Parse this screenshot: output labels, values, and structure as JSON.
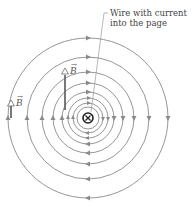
{
  "diagram": {
    "annotation": {
      "line1": "Wire with current",
      "line2": "into the page"
    },
    "vector_label": "B",
    "vector_arrow": "→",
    "wire_symbol": "current-into-page",
    "field_direction": "clockwise",
    "center": [
      88,
      118
    ],
    "radii": [
      80,
      61,
      46,
      35,
      26,
      20,
      15,
      11
    ],
    "colors": {
      "field_line": "#8a8a8a",
      "vector": "#6a6a6a",
      "wire": "#222222"
    }
  }
}
